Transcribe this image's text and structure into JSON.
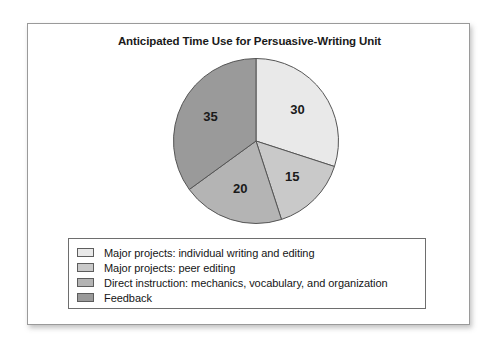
{
  "chart_data": {
    "type": "pie",
    "title": "Anticipated Time Use for Persuasive-Writing Unit",
    "categories": [
      "Major projects: individual writing and editing",
      "Major projects: peer editing",
      "Direct instruction: mechanics, vocabulary, and organization",
      "Feedback"
    ],
    "values": [
      30,
      15,
      20,
      35
    ],
    "value_labels": [
      "30",
      "15",
      "20",
      "35"
    ],
    "units": "percent",
    "start_angle_deg": 0,
    "direction": "clockwise",
    "slice_colors": [
      "#e9e9e9",
      "#c9c9c9",
      "#b4b4b4",
      "#9a9a9a"
    ],
    "slice_border_color": "#555555",
    "legend": {
      "position": "bottom",
      "entries": [
        {
          "label": "Major projects: individual writing and editing",
          "color": "#e9e9e9",
          "value": 30
        },
        {
          "label": "Major projects: peer editing",
          "color": "#c9c9c9",
          "value": 15
        },
        {
          "label": "Direct instruction: mechanics, vocabulary, and organization",
          "color": "#b4b4b4",
          "value": 20
        },
        {
          "label": "Feedback",
          "color": "#9a9a9a",
          "value": 35
        }
      ]
    },
    "grid": false,
    "xlabel": "",
    "ylabel": ""
  }
}
